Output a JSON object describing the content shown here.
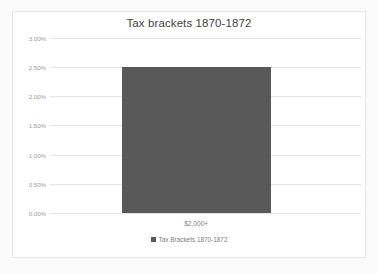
{
  "chart_data": {
    "type": "bar",
    "title": "Tax brackets 1870-1872",
    "categories": [
      "$2,000+"
    ],
    "values": [
      2.5
    ],
    "series": [
      {
        "name": "Tax Brackets 1870-1872",
        "values": [
          2.5
        ]
      }
    ],
    "xlabel": "",
    "ylabel": "",
    "ylim": [
      0.0,
      3.0
    ],
    "ytick_labels": [
      "3.00%",
      "2.50%",
      "2.00%",
      "1.50%",
      "1.00%",
      "0.50%",
      "0.00%"
    ],
    "ytick_values": [
      3.0,
      2.5,
      2.0,
      1.5,
      1.0,
      0.5,
      0.0
    ],
    "grid": true,
    "legend_position": "bottom",
    "legend": [
      {
        "label": "Tax Brackets 1870-1872",
        "color": "#595959",
        "marker": "square-swatch-icon"
      }
    ],
    "colors": {
      "bar": "#595959",
      "gridline": "#e4e4e4",
      "title_text": "#3f3f3f",
      "tick_text": "#9a9a9a",
      "border": "#e6e6e6",
      "plot_background": "#ffffff",
      "page_background": "#fbfbfb"
    }
  }
}
